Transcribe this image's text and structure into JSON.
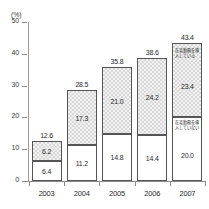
{
  "chart_data": {
    "type": "bar",
    "stacked": true,
    "title": "",
    "subtitle": "",
    "xlabel": "",
    "ylabel": "",
    "unit_label": "(%)",
    "ylim": [
      0,
      50
    ],
    "yticks": [
      0,
      10,
      20,
      30,
      40,
      50
    ],
    "ytick_labels": [
      "0",
      "10",
      "20",
      "30",
      "40",
      "50"
    ],
    "grid": false,
    "legend_position": "in-bar-annotation",
    "categories": [
      "2003",
      "2004",
      "2005",
      "2006",
      "2007"
    ],
    "series": [
      {
        "name": "lower-segment",
        "annotation": "在宅勤務を導入していない",
        "values": [
          6.4,
          11.2,
          14.8,
          14.4,
          20.0
        ],
        "value_labels": [
          "6.4",
          "11.2",
          "14.8",
          "14.4",
          "20.0"
        ],
        "fill": "#ffffff",
        "pattern": "solid"
      },
      {
        "name": "upper-segment",
        "annotation": "在宅勤務を導入している",
        "values": [
          6.2,
          17.3,
          21.0,
          24.2,
          23.4
        ],
        "value_labels": [
          "6.2",
          "17.3",
          "21.0",
          "24.2",
          "23.4"
        ],
        "fill": "#f2f2f2",
        "pattern": "checkered"
      }
    ],
    "totals": [
      12.6,
      28.5,
      35.8,
      38.6,
      43.4
    ],
    "total_labels": [
      "12.6",
      "28.5",
      "35.8",
      "38.6",
      "43.4"
    ]
  }
}
